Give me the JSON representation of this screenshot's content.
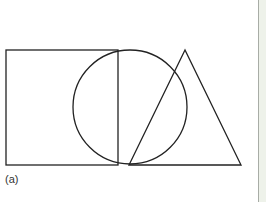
{
  "figure": {
    "label": "(a)",
    "stroke_color": "#222222",
    "shapes": [
      {
        "type": "square",
        "x": 6,
        "y": 50,
        "width": 112,
        "height": 115
      },
      {
        "type": "circle",
        "cx": 130,
        "cy": 107,
        "r": 57
      },
      {
        "type": "triangle",
        "points": [
          [
            185,
            50
          ],
          [
            129,
            165
          ],
          [
            241,
            165
          ]
        ]
      }
    ]
  },
  "side_panel": {
    "background": "#eef2ea",
    "rule_color": "#a8aca6"
  }
}
